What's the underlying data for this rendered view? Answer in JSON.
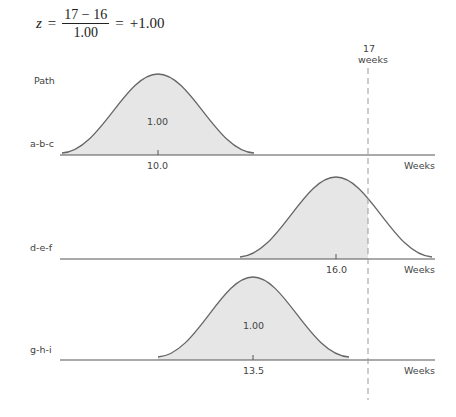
{
  "equation": {
    "lhs": "z",
    "equals1": "=",
    "numerator": "17 − 16",
    "denominator": "1.00",
    "equals2": "=",
    "result": "+1.00"
  },
  "diagram": {
    "column_header": "Path",
    "threshold": {
      "value": 17,
      "label_line1": "17",
      "label_line2": "weeks"
    },
    "axis_label": "Weeks",
    "paths": [
      {
        "name": "a-b-c",
        "mean": "10.0",
        "area_label": "1.00"
      },
      {
        "name": "d-e-f",
        "mean": "16.0",
        "area_label": ""
      },
      {
        "name": "g-h-i",
        "mean": "13.5",
        "area_label": "1.00"
      }
    ]
  },
  "colors": {
    "fill": "#e6e6e6",
    "stroke": "#666666",
    "axis": "#555555",
    "dash": "#999999"
  }
}
